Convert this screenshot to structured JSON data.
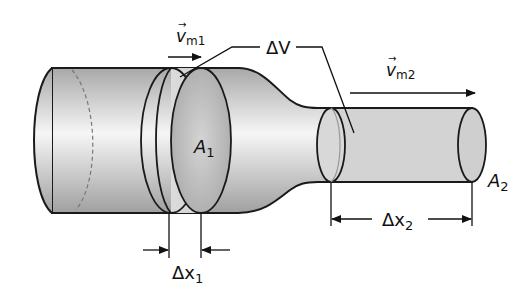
{
  "diagram": {
    "labels": {
      "v1_symbol": "v",
      "v1_sub": "m1",
      "v2_symbol": "v",
      "v2_sub": "m2",
      "delta_v": "ΔV",
      "a1": "A",
      "a1_sub": "1",
      "a2": "A",
      "a2_sub": "2",
      "dx1": "Δx",
      "dx1_sub": "1",
      "dx2": "Δx",
      "dx2_sub": "2"
    },
    "colors": {
      "pipe_light": "#f4f4f4",
      "pipe_dark": "#9a9a9a",
      "slab_fill": "#d6d6d6",
      "outline": "#1a1a1a"
    }
  }
}
